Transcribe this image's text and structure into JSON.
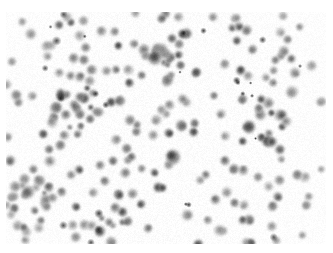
{
  "image": {
    "kind": "brightfield-microscopy-field",
    "modality": "light microscopy, unstained / lightly stained cell suspension",
    "title": "",
    "caption": "",
    "overlay_text": "",
    "scale_bar_label": "",
    "colors": {
      "background": "#ffffff",
      "field_background": "#fdfdfd",
      "cell_rim": "#c8c8c8",
      "cell_body": "#9c9c9c",
      "cell_nucleus": "#5a5a5a",
      "cell_nucleus_dark": "#2e2e2e",
      "debris": "#1a1a1a"
    },
    "field": {
      "x": 6,
      "y": 12,
      "width": 320,
      "height": 232,
      "margin_top_px": 12,
      "margin_left_px": 6,
      "margin_right_px": 7,
      "margin_bottom_px": 9
    },
    "render": {
      "blur_px": 0.9,
      "grain_opacity": 0.05,
      "seed": 20240517
    },
    "statistics": {
      "cell_count": 248,
      "debris_count": 26,
      "cell_diameter_min_px": 5,
      "cell_diameter_max_px": 17,
      "cell_diameter_mean_px": 9.6,
      "cluster_count": 5
    },
    "clusters": [
      {
        "cx": 72,
        "cy": 104,
        "radius": 26,
        "members": 14
      },
      {
        "cx": 156,
        "cy": 60,
        "radius": 16,
        "members": 9
      },
      {
        "cx": 30,
        "cy": 196,
        "radius": 22,
        "members": 10
      },
      {
        "cx": 268,
        "cy": 126,
        "radius": 24,
        "members": 11
      },
      {
        "cx": 112,
        "cy": 228,
        "radius": 20,
        "members": 8
      }
    ],
    "notable_cells": [
      {
        "cx": 173,
        "cy": 157,
        "d": 16,
        "tone": "very-dark",
        "note": "largest darkest cell, lower-mid field"
      },
      {
        "cx": 249,
        "cy": 127,
        "d": 14,
        "tone": "dark",
        "note": "large dark cell, right of center"
      },
      {
        "cx": 28,
        "cy": 192,
        "d": 14,
        "tone": "dark",
        "note": "large dark cell, lower left"
      },
      {
        "cx": 155,
        "cy": 58,
        "d": 15,
        "tone": "dark",
        "note": "overlapping doublet cluster, upper mid"
      },
      {
        "cx": 292,
        "cy": 92,
        "d": 13,
        "tone": "medium",
        "note": "large pale cell, upper right"
      }
    ]
  }
}
